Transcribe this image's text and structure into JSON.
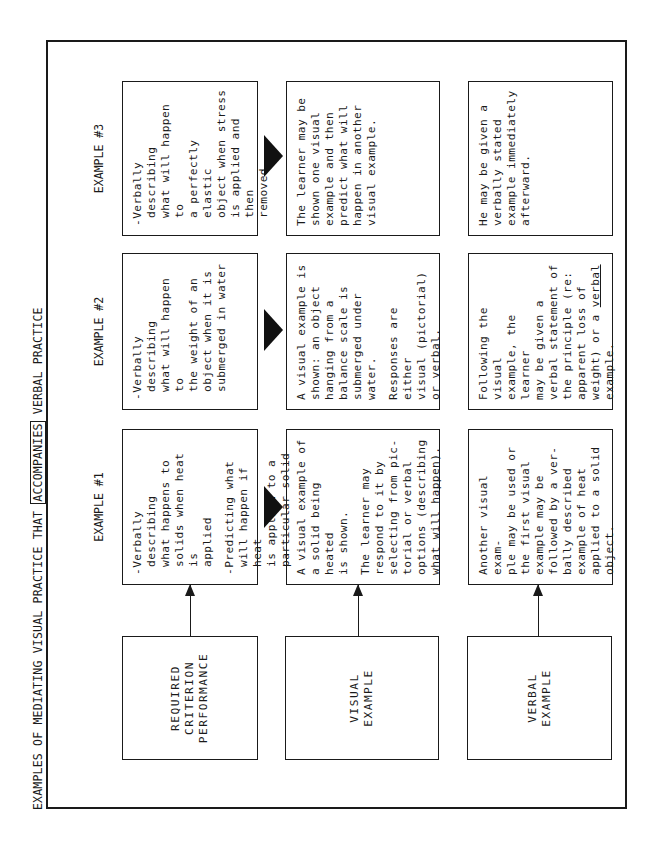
{
  "title": {
    "before": "EXAMPLES OF MEDIATING VISUAL PRACTICE THAT ",
    "boxed": "ACCOMPANIES",
    "after": " VERBAL PRACTICE"
  },
  "headers": [
    "EXAMPLE #1",
    "EXAMPLE #2",
    "EXAMPLE #3"
  ],
  "rows": [
    {
      "label": "REQUIRED\nCRITERION\nPERFORMANCE",
      "cells": [
        [
          "-Verbally describing\nwhat happens to\nsolids when heat is\napplied",
          "-Predicting what\nwill happen if heat\nis applied to a\nparticular solid"
        ],
        [
          "-Verbally describing\nwhat will happen to\nthe weight of an\nobject when it is\nsubmerged in water"
        ],
        [
          "-Verbally describing\nwhat will happen to\na perfectly elastic\nobject when stress\nis applied and then\nremoved"
        ]
      ]
    },
    {
      "label": "VISUAL\nEXAMPLE",
      "cells": [
        [
          "A visual example of\na solid being heated\nis shown.",
          "The learner may\nrespond to it by\nselecting from pic-\ntorial or verbal\noptions (describing\nwhat will happen)."
        ],
        [
          "A visual example is\nshown:  an object\nhanging from a\nbalance scale is\nsubmerged under\nwater.",
          "Responses are either\nvisual (pictorial)\nor verbal."
        ],
        [
          "The learner may be\nshown one visual\nexample and then\npredict what will\nhappen in another\nvisual example."
        ]
      ]
    },
    {
      "label": "VERBAL\nEXAMPLE",
      "cells": [
        [
          "Another visual exam-\nple may be used or\nthe first visual\nexample may be\nfollowed by a ver-\nbally described\nexample of heat\napplied to a solid\nobject."
        ],
        [
          "Following the visual\nexample, the learner\nmay be given a\nverbal statement of\nthe principle (re:\napparent loss of\nweight) or a ",
          "verbal",
          "\nexample."
        ],
        [
          "He may be given a\nverbally stated\nexample immediately\nafterward."
        ]
      ]
    }
  ]
}
